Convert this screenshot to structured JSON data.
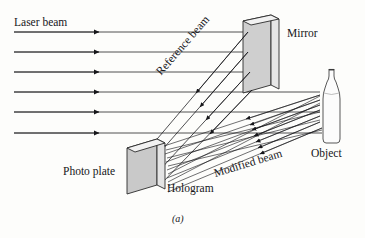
{
  "figure": {
    "caption": "(a)",
    "background_color": "#fdfdfb",
    "ink_color": "#16161a"
  },
  "labels": {
    "laser_beam": "Laser beam",
    "reference_beam": "Reference beam",
    "mirror": "Mirror",
    "object": "Object",
    "photo_plate": "Photo plate",
    "hologram": "Hologram",
    "modified_beam": "Modified beam"
  },
  "diagram_data": {
    "type": "optics-schematic",
    "topic": "Holography recording setup",
    "components": [
      {
        "name": "mirror",
        "shape": "tilted-rectangular-slab",
        "face_color": "#cfcfcf",
        "edge_color": "#2a2a2a",
        "bounds": {
          "x": 240,
          "y": 15,
          "width": 42,
          "height": 78
        }
      },
      {
        "name": "photo-plate",
        "shape": "tilted-rectangular-slab",
        "face_color": "#c9c9c9",
        "edge_color": "#2a2a2a",
        "bounds": {
          "x": 125,
          "y": 138,
          "width": 42,
          "height": 54
        },
        "alt_name": "hologram"
      },
      {
        "name": "object-bottle",
        "shape": "bottle-outline",
        "face_color": "#fbfbfb",
        "edge_color": "#3a3a3a",
        "bounds": {
          "x": 320,
          "y": 68,
          "width": 22,
          "height": 76
        }
      }
    ],
    "laser_beams": {
      "description": "Six parallel horizontal rays travelling left to right",
      "count": 6,
      "y_positions": [
        32,
        52,
        72,
        92,
        112,
        133
      ],
      "x_start": 14,
      "arrowhead_x": 96,
      "x_end_upper": 248,
      "x_end_lower": 320
    },
    "reference_beams": {
      "description": "Rays reflected from mirror down-left toward photo plate",
      "count": 4,
      "angle_deg": -49
    },
    "modified_beams": {
      "description": "Scattered rays from object converging on the photo plate",
      "count": 12,
      "origin": {
        "x": 321,
        "y": 105
      }
    }
  }
}
